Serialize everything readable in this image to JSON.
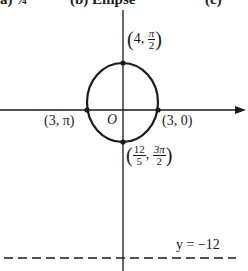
{
  "header": {
    "fragments": [
      "a)  ¼",
      "(b)  Ellipse",
      "(c)"
    ]
  },
  "diagram": {
    "type": "polar-conic",
    "shape": "ellipse",
    "origin_label": "O",
    "points": {
      "top": {
        "r": "4",
        "theta_num": "π",
        "theta_den": "2"
      },
      "right": {
        "label": "(3, 0)"
      },
      "left": {
        "label": "(3, π)"
      },
      "bottom": {
        "r_num": "12",
        "r_den": "5",
        "theta_num": "3π",
        "theta_den": "2"
      }
    },
    "directrix": {
      "label": "y = −12"
    },
    "colors": {
      "stroke": "#1a1a1a",
      "background": "#ffffff"
    }
  }
}
